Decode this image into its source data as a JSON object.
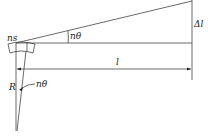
{
  "diagram": {
    "type": "optical-lever geometry",
    "labels": {
      "ns": "ns",
      "angle_top": "nθ",
      "delta_l": "Δl",
      "l": "l",
      "R": "R",
      "angle_bottom": "nθ"
    },
    "colors": {
      "line": "#444444",
      "text": "#222222",
      "background": "#ffffff"
    }
  }
}
